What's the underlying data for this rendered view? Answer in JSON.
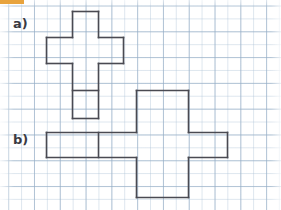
{
  "page": {
    "width": 281,
    "height": 210,
    "background_color": "#ffffff"
  },
  "grid": {
    "name": "graph-paper",
    "minor_spacing_px": 12.9,
    "major_spacing_px": 25.8,
    "minor_color": "#b0c4d8",
    "major_color": "#96aec6",
    "origin_x": 8.2,
    "origin_y": 5.5
  },
  "corner_mark": {
    "color": "#e8a33d",
    "width": 24,
    "height": 4
  },
  "labels": [
    {
      "id": "a",
      "text": "a)",
      "x": 13,
      "y": 17
    },
    {
      "id": "b",
      "text": "b)",
      "x": 13,
      "y": 133
    }
  ],
  "stroke": {
    "color": "#4a4a52",
    "width": 1.6
  },
  "figures": [
    {
      "id": "net-a",
      "label": "a)",
      "description": "cross-shaped net outline with one interior divider line",
      "segments": [
        {
          "name": "a-top-cell-left",
          "x1": 72.5,
          "y1": 11.5,
          "x2": 72.5,
          "y2": 37.5
        },
        {
          "name": "a-top-cell-top",
          "x1": 72.5,
          "y1": 11.5,
          "x2": 98.5,
          "y2": 11.5
        },
        {
          "name": "a-top-cell-right",
          "x1": 98.5,
          "y1": 11.5,
          "x2": 98.5,
          "y2": 37.5
        },
        {
          "name": "a-bar-top-left",
          "x1": 46.5,
          "y1": 37.5,
          "x2": 72.5,
          "y2": 37.5
        },
        {
          "name": "a-bar-top-right",
          "x1": 98.5,
          "y1": 37.5,
          "x2": 123.5,
          "y2": 37.5
        },
        {
          "name": "a-bar-left",
          "x1": 46.5,
          "y1": 37.5,
          "x2": 46.5,
          "y2": 63.5
        },
        {
          "name": "a-bar-right",
          "x1": 123.5,
          "y1": 37.5,
          "x2": 123.5,
          "y2": 63.5
        },
        {
          "name": "a-bar-bottom-left",
          "x1": 46.5,
          "y1": 63.5,
          "x2": 72.5,
          "y2": 63.5
        },
        {
          "name": "a-bar-bottom-right",
          "x1": 98.5,
          "y1": 63.5,
          "x2": 123.5,
          "y2": 63.5
        },
        {
          "name": "a-stem-left",
          "x1": 72.5,
          "y1": 63.5,
          "x2": 72.5,
          "y2": 118.5
        },
        {
          "name": "a-stem-right",
          "x1": 98.5,
          "y1": 63.5,
          "x2": 98.5,
          "y2": 118.5
        },
        {
          "name": "a-stem-divider",
          "x1": 72.5,
          "y1": 90.5,
          "x2": 98.5,
          "y2": 90.5
        },
        {
          "name": "a-stem-bottom",
          "x1": 72.5,
          "y1": 118.5,
          "x2": 98.5,
          "y2": 118.5
        }
      ]
    },
    {
      "id": "net-b",
      "label": "b)",
      "description": "cross-shaped net: long horizontal bar with divider crossed by tall vertical rectangle",
      "segments": [
        {
          "name": "b-vert-left-upper",
          "x1": 136.5,
          "y1": 90.5,
          "x2": 136.5,
          "y2": 132.5
        },
        {
          "name": "b-vert-left-lower",
          "x1": 136.5,
          "y1": 157.5,
          "x2": 136.5,
          "y2": 197.5
        },
        {
          "name": "b-vert-top",
          "x1": 136.5,
          "y1": 90.5,
          "x2": 188.5,
          "y2": 90.5
        },
        {
          "name": "b-vert-right-upper",
          "x1": 188.5,
          "y1": 90.5,
          "x2": 188.5,
          "y2": 132.5
        },
        {
          "name": "b-vert-right-lower",
          "x1": 188.5,
          "y1": 157.5,
          "x2": 188.5,
          "y2": 197.5
        },
        {
          "name": "b-vert-bottom",
          "x1": 136.5,
          "y1": 197.5,
          "x2": 188.5,
          "y2": 197.5
        },
        {
          "name": "b-bar-top-left",
          "x1": 46.5,
          "y1": 132.5,
          "x2": 136.5,
          "y2": 132.5
        },
        {
          "name": "b-bar-top-right",
          "x1": 188.5,
          "y1": 132.5,
          "x2": 227.5,
          "y2": 132.5
        },
        {
          "name": "b-bar-left",
          "x1": 46.5,
          "y1": 132.5,
          "x2": 46.5,
          "y2": 157.5
        },
        {
          "name": "b-bar-right",
          "x1": 227.5,
          "y1": 132.5,
          "x2": 227.5,
          "y2": 157.5
        },
        {
          "name": "b-bar-bottom-left",
          "x1": 46.5,
          "y1": 157.5,
          "x2": 136.5,
          "y2": 157.5
        },
        {
          "name": "b-bar-bottom-right",
          "x1": 188.5,
          "y1": 157.5,
          "x2": 227.5,
          "y2": 157.5
        },
        {
          "name": "b-bar-divider",
          "x1": 98.5,
          "y1": 132.5,
          "x2": 98.5,
          "y2": 157.5
        }
      ]
    }
  ]
}
